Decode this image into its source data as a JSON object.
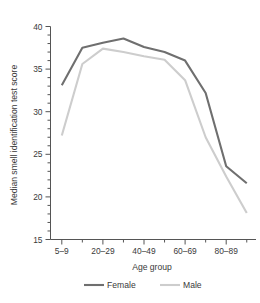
{
  "chart_data": {
    "type": "line",
    "title": "",
    "xlabel": "Age group",
    "ylabel": "Median smell identification test score",
    "categories": [
      "5–9",
      "10–19",
      "20–29",
      "30–39",
      "40–49",
      "50–59",
      "60–69",
      "70–79",
      "80–89",
      "90+"
    ],
    "labeled_categories": [
      "5–9",
      "20–29",
      "40–49",
      "60–69",
      "80–89"
    ],
    "series": [
      {
        "name": "Female",
        "color": "#6f6f6f",
        "values": [
          33.1,
          37.5,
          38.1,
          38.6,
          37.6,
          37.0,
          36.0,
          32.2,
          23.6,
          21.6
        ]
      },
      {
        "name": "Male",
        "color": "#cdcdcd",
        "values": [
          27.2,
          35.6,
          37.4,
          37.0,
          36.5,
          36.1,
          33.7,
          27.0,
          22.4,
          18.1
        ]
      }
    ],
    "ylim": [
      15,
      40
    ],
    "ytick_labels": [
      "40",
      "35",
      "30",
      "25",
      "20",
      "15"
    ],
    "ytick_values": [
      40,
      35,
      30,
      25,
      20,
      15
    ],
    "y_minor_step": 1,
    "grid": false,
    "legend_position": "bottom-center"
  },
  "legend": {
    "entries": [
      {
        "label": "Female",
        "color": "#6f6f6f"
      },
      {
        "label": "Male",
        "color": "#cdcdcd"
      }
    ]
  },
  "axes": {
    "x_title": "Age group",
    "y_title": "Median smell identification test score"
  }
}
